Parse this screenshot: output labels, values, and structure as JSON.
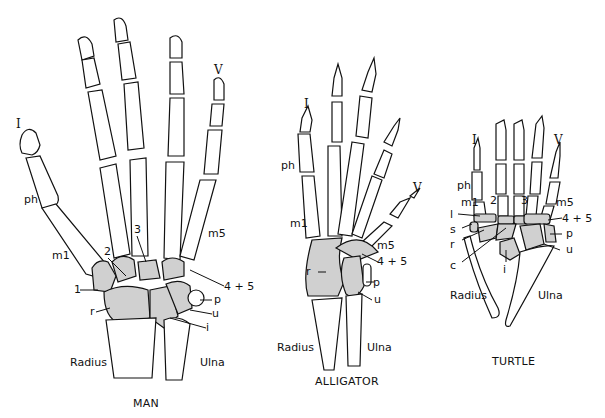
{
  "figure": {
    "fill_color_carpals": "#d0d0d0",
    "line_color": "#111111",
    "panels": [
      {
        "title": "MAN",
        "labels": {
          "digit_first": "I",
          "digit_fifth": "V",
          "phalanx": "ph",
          "metacarpal_1": "m1",
          "metacarpal_5": "m5",
          "carpal_1": "1",
          "carpal_2": "2",
          "carpal_3": "3",
          "carpal_45": "4 + 5",
          "pisiform": "p",
          "ulnare": "u",
          "radiale": "r",
          "intermedium": "i",
          "radius": "Radius",
          "ulna": "Ulna"
        }
      },
      {
        "title": "ALLIGATOR",
        "labels": {
          "digit_first": "I",
          "digit_fifth": "V",
          "phalanx": "ph",
          "metacarpal_1": "m1",
          "metacarpal_5": "m5",
          "carpal_45": "4 + 5",
          "radiale": "r",
          "pisiform": "p",
          "ulnare": "u",
          "radius": "Radius",
          "ulna": "Ulna"
        }
      },
      {
        "title": "TURTLE",
        "labels": {
          "digit_first": "I",
          "digit_fifth": "V",
          "phalanx": "ph",
          "metacarpal_1": "m1",
          "metacarpal_5": "m5",
          "carpal_1": "l",
          "carpal_2": "2",
          "carpal_3": "3",
          "carpal_45": "4 + 5",
          "sesamoid": "s",
          "radiale": "r",
          "centrale": "c",
          "intermedium": "i",
          "pisiform": "p",
          "ulnare": "u",
          "radius": "Radius",
          "ulna": "Ulna"
        }
      }
    ]
  }
}
